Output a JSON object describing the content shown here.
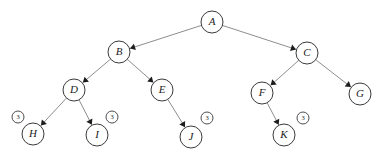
{
  "diagram": {
    "type": "tree",
    "background_color": "#ffffff",
    "node_fill": "#ffffff",
    "node_stroke": "#3a3a3a",
    "edge_color": "#8e8e8e",
    "arrowhead_color": "#1c1c1c",
    "label_color": "#1c1c1c",
    "node_radius": 11,
    "badge_radius": 6,
    "nodes": [
      {
        "id": "A",
        "label": "A",
        "x": 212,
        "y": 22,
        "badge": null,
        "badge_side": null
      },
      {
        "id": "B",
        "label": "B",
        "x": 119,
        "y": 52,
        "badge": null,
        "badge_side": null
      },
      {
        "id": "C",
        "label": "C",
        "x": 307,
        "y": 53,
        "badge": null,
        "badge_side": null
      },
      {
        "id": "D",
        "label": "D",
        "x": 74,
        "y": 90,
        "badge": null,
        "badge_side": null
      },
      {
        "id": "E",
        "label": "E",
        "x": 162,
        "y": 90,
        "badge": null,
        "badge_side": null
      },
      {
        "id": "F",
        "label": "F",
        "x": 262,
        "y": 93,
        "badge": null,
        "badge_side": null
      },
      {
        "id": "G",
        "label": "G",
        "x": 360,
        "y": 94,
        "badge": null,
        "badge_side": null
      },
      {
        "id": "H",
        "label": "H",
        "x": 33,
        "y": 134,
        "badge": "3",
        "badge_side": "left",
        "badge_x": 18,
        "badge_y": 117
      },
      {
        "id": "I",
        "label": "I",
        "x": 97,
        "y": 135,
        "badge": "3",
        "badge_side": "right",
        "badge_x": 112,
        "badge_y": 117
      },
      {
        "id": "J",
        "label": "J",
        "x": 191,
        "y": 137,
        "badge": "3",
        "badge_side": "right",
        "badge_x": 207,
        "badge_y": 118
      },
      {
        "id": "K",
        "label": "K",
        "x": 284,
        "y": 135,
        "badge": "3",
        "badge_side": "right",
        "badge_x": 303,
        "badge_y": 118
      }
    ],
    "edges": [
      {
        "from": "A",
        "to": "B",
        "directed": true
      },
      {
        "from": "A",
        "to": "C",
        "directed": true
      },
      {
        "from": "B",
        "to": "D",
        "directed": true
      },
      {
        "from": "B",
        "to": "E",
        "directed": true
      },
      {
        "from": "C",
        "to": "F",
        "directed": true
      },
      {
        "from": "C",
        "to": "G",
        "directed": true
      },
      {
        "from": "D",
        "to": "H",
        "directed": true
      },
      {
        "from": "D",
        "to": "I",
        "directed": true
      },
      {
        "from": "E",
        "to": "J",
        "directed": true
      },
      {
        "from": "F",
        "to": "K",
        "directed": true
      }
    ]
  }
}
